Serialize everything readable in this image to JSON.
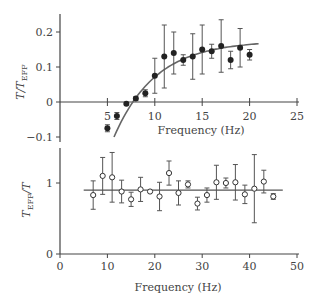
{
  "chart_data": [
    {
      "type": "scatter",
      "panel": "top",
      "xlabel": "Frequency (Hz)",
      "ylabel": "T/T_EFF",
      "xlim": [
        0,
        25
      ],
      "ylim": [
        -0.12,
        0.24
      ],
      "xticks": [
        5,
        10,
        15,
        20,
        25
      ],
      "yticks": [
        -0.1,
        0,
        0.1,
        0.2
      ],
      "ytick_labels": [
        "−0.1",
        "0",
        "0.1",
        "0.2"
      ],
      "marker": "filled-circle",
      "points": [
        {
          "x": 5,
          "y": -0.075,
          "err": 0.01
        },
        {
          "x": 6,
          "y": -0.04,
          "err": 0.01
        },
        {
          "x": 7,
          "y": -0.005,
          "err": 0.003
        },
        {
          "x": 8,
          "y": 0.01,
          "err": 0.005
        },
        {
          "x": 9,
          "y": 0.025,
          "err": 0.01
        },
        {
          "x": 10,
          "y": 0.075,
          "err": 0.05
        },
        {
          "x": 11,
          "y": 0.13,
          "err": 0.09
        },
        {
          "x": 12,
          "y": 0.14,
          "err": 0.06
        },
        {
          "x": 13,
          "y": 0.12,
          "err": 0.015
        },
        {
          "x": 14,
          "y": 0.13,
          "err": 0.065
        },
        {
          "x": 15,
          "y": 0.15,
          "err": 0.07
        },
        {
          "x": 16,
          "y": 0.145,
          "err": 0.02
        },
        {
          "x": 17,
          "y": 0.16,
          "err": 0.075
        },
        {
          "x": 18,
          "y": 0.12,
          "err": 0.025
        },
        {
          "x": 19,
          "y": 0.155,
          "err": 0.055
        },
        {
          "x": 20,
          "y": 0.135,
          "err": 0.015
        }
      ],
      "fit_curve": {
        "x_start": 5.7,
        "x_end": 21,
        "description": "saturating curve rising from ~-0.1 at 5.7 Hz to ~0.155 at 21 Hz"
      }
    },
    {
      "type": "scatter",
      "panel": "bottom",
      "xlabel": "Frequency (Hz)",
      "ylabel": "T_EFF/T",
      "xlim": [
        0,
        50
      ],
      "ylim": [
        0,
        1.5
      ],
      "xticks": [
        0,
        10,
        20,
        30,
        40,
        50
      ],
      "yticks": [
        0,
        1
      ],
      "marker": "open-circle",
      "points": [
        {
          "x": 7,
          "y": 0.83,
          "err": 0.2
        },
        {
          "x": 9,
          "y": 1.1,
          "err": 0.26
        },
        {
          "x": 11,
          "y": 1.08,
          "err": 0.35
        },
        {
          "x": 13,
          "y": 0.88,
          "err": 0.16
        },
        {
          "x": 15,
          "y": 0.77,
          "err": 0.1
        },
        {
          "x": 17,
          "y": 0.91,
          "err": 0.17
        },
        {
          "x": 19,
          "y": 0.88,
          "err": 0.01
        },
        {
          "x": 21,
          "y": 0.81,
          "err": 0.2
        },
        {
          "x": 23,
          "y": 1.14,
          "err": 0.17
        },
        {
          "x": 25,
          "y": 0.86,
          "err": 0.17
        },
        {
          "x": 27,
          "y": 0.98,
          "err": 0.05
        },
        {
          "x": 29,
          "y": 0.71,
          "err": 0.09
        },
        {
          "x": 31,
          "y": 0.83,
          "err": 0.1
        },
        {
          "x": 33,
          "y": 1.01,
          "err": 0.24
        },
        {
          "x": 35,
          "y": 1.0,
          "err": 0.07
        },
        {
          "x": 37,
          "y": 1.01,
          "err": 0.25
        },
        {
          "x": 39,
          "y": 0.84,
          "err": 0.13
        },
        {
          "x": 41,
          "y": 0.92,
          "err": 0.48
        },
        {
          "x": 43,
          "y": 1.02,
          "err": 0.16
        },
        {
          "x": 45,
          "y": 0.81,
          "err": 0.04
        }
      ],
      "fit_line": {
        "y": 0.9,
        "x_start": 5,
        "x_end": 47
      }
    }
  ],
  "labels": {
    "top_xlabel": "Frequency (Hz)",
    "bottom_xlabel": "Frequency (Hz)"
  }
}
